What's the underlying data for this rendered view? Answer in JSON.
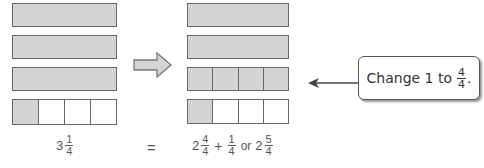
{
  "diagram": {
    "left_model": {
      "rows": [
        {
          "type": "whole",
          "shaded": true
        },
        {
          "type": "whole",
          "shaded": true
        },
        {
          "type": "whole",
          "shaded": true
        },
        {
          "type": "fourths",
          "shaded_parts": 1,
          "parts": 4
        }
      ],
      "label": {
        "whole": "3",
        "numerator": "1",
        "denominator": "4"
      }
    },
    "transform_arrow": "right-arrow",
    "right_model": {
      "rows": [
        {
          "type": "whole",
          "shaded": true
        },
        {
          "type": "whole",
          "shaded": true
        },
        {
          "type": "fourths",
          "shaded_parts": 4,
          "parts": 4
        },
        {
          "type": "fourths",
          "shaded_parts": 1,
          "parts": 4
        }
      ],
      "label": {
        "term1_whole": "2",
        "term1_num": "4",
        "term1_den": "4",
        "plus": "+",
        "term2_num": "1",
        "term2_den": "4",
        "or": "or",
        "result_whole": "2",
        "result_num": "5",
        "result_den": "4"
      }
    },
    "equals": "=",
    "callout": {
      "text": "Change 1 to",
      "numerator": "4",
      "denominator": "4",
      "suffix": "."
    },
    "colors": {
      "shaded": "#d4d4d4",
      "border": "#666666",
      "text": "#555555"
    }
  }
}
